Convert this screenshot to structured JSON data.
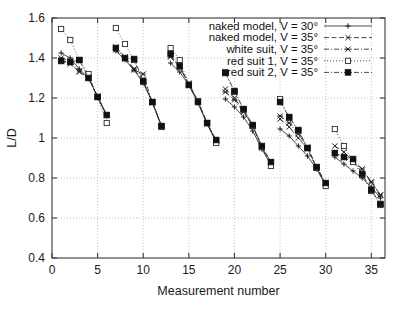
{
  "chart_data": {
    "type": "line",
    "title": "",
    "xlabel": "Measurement number",
    "ylabel": "L/D",
    "xlim": [
      0,
      36.5
    ],
    "ylim": [
      0.4,
      1.6
    ],
    "xticks": [
      0,
      5,
      10,
      15,
      20,
      25,
      30,
      35
    ],
    "yticks": [
      0.4,
      0.6,
      0.8,
      1,
      1.2,
      1.4,
      1.6
    ],
    "xticklabels": [
      "0",
      "5",
      "10",
      "15",
      "20",
      "25",
      "30",
      "35"
    ],
    "yticklabels": [
      "0.4",
      "0.6",
      "0.8",
      "1",
      "1.2",
      "1.4",
      "1.6"
    ],
    "grid": true,
    "legend_position": "top-right",
    "x": [
      1,
      2,
      3,
      4,
      5,
      6,
      7,
      8,
      9,
      10,
      11,
      12,
      13,
      14,
      15,
      16,
      17,
      18,
      19,
      20,
      21,
      22,
      23,
      24,
      25,
      26,
      27,
      28,
      29,
      30,
      31,
      32,
      33,
      34,
      35,
      36
    ],
    "series": [
      {
        "name": "naked model, V = 30°",
        "marker": "plus",
        "linestyle": "solid",
        "values": [
          1.425,
          1.4,
          1.345,
          1.3,
          1.205,
          1.11,
          1.435,
          1.39,
          1.34,
          1.275,
          1.18,
          1.06,
          1.375,
          1.33,
          1.265,
          1.175,
          1.07,
          0.98,
          1.195,
          1.155,
          1.105,
          1.035,
          0.945,
          0.865,
          1.045,
          1.01,
          0.96,
          0.91,
          0.845,
          0.765,
          0.905,
          0.87,
          0.835,
          0.8,
          0.755,
          0.7
        ]
      },
      {
        "name": "naked model, V = 35°",
        "marker": "cross",
        "linestyle": "dashed",
        "values": [
          1.385,
          1.37,
          1.33,
          1.3,
          1.205,
          1.115,
          1.455,
          1.405,
          1.345,
          1.28,
          1.18,
          1.06,
          1.41,
          1.355,
          1.275,
          1.185,
          1.075,
          0.985,
          1.245,
          1.2,
          1.135,
          1.06,
          0.955,
          0.875,
          1.095,
          1.055,
          1.0,
          0.945,
          0.85,
          0.77,
          0.96,
          0.93,
          0.885,
          0.845,
          0.78,
          0.715
        ]
      },
      {
        "name": "white suit, V = 35°",
        "marker": "star",
        "linestyle": "dashdot",
        "values": [
          1.4,
          1.385,
          1.335,
          1.305,
          1.21,
          1.115,
          1.44,
          1.395,
          1.34,
          1.32,
          1.175,
          1.06,
          1.405,
          1.35,
          1.27,
          1.18,
          1.07,
          0.985,
          1.23,
          1.19,
          1.13,
          1.06,
          0.95,
          0.88,
          1.11,
          1.075,
          1.02,
          0.955,
          0.855,
          0.775,
          0.925,
          0.9,
          0.88,
          0.845,
          0.78,
          0.715
        ]
      },
      {
        "name": "red suit 1, V = 35°",
        "marker": "square-open",
        "linestyle": "dotted",
        "values": [
          1.545,
          1.49,
          1.39,
          1.32,
          1.205,
          1.075,
          1.55,
          1.47,
          1.39,
          1.28,
          1.18,
          1.055,
          1.45,
          1.39,
          1.265,
          1.185,
          1.075,
          0.975,
          1.33,
          1.23,
          1.14,
          1.06,
          0.955,
          0.86,
          1.195,
          1.1,
          1.035,
          0.95,
          0.85,
          0.76,
          1.045,
          0.96,
          0.88,
          0.815,
          0.735,
          0.665
        ]
      },
      {
        "name": "red suit 2, V = 35°",
        "marker": "square-filled",
        "linestyle": "dashdot",
        "values": [
          1.385,
          1.38,
          1.39,
          1.3,
          1.205,
          1.115,
          1.45,
          1.4,
          1.395,
          1.285,
          1.18,
          1.06,
          1.42,
          1.36,
          1.265,
          1.18,
          1.075,
          0.99,
          1.325,
          1.235,
          1.145,
          1.065,
          0.96,
          0.88,
          1.18,
          1.105,
          1.04,
          0.95,
          0.855,
          0.775,
          0.925,
          0.905,
          0.895,
          0.82,
          0.74,
          0.67
        ]
      }
    ],
    "colors": {
      "foreground": "#1d1d1d",
      "grid": "#aaaaaa",
      "background": "#ffffff"
    }
  }
}
